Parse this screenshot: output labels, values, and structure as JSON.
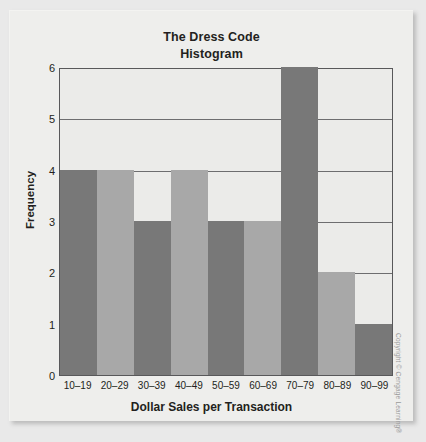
{
  "figure": {
    "title_line1": "The Dress Code",
    "title_line2": "Histogram",
    "copyright": "Copyright © Cengage Learning®",
    "panel_bg": "#eeeeec",
    "plot_bg": "#ebebe9",
    "axis_color": "#58585a",
    "text_color": "#231f20"
  },
  "chart_data": {
    "type": "bar",
    "title": "The Dress Code Histogram",
    "xlabel": "Dollar Sales per Transaction",
    "ylabel": "Frequency",
    "categories": [
      "10–19",
      "20–29",
      "30–39",
      "40–49",
      "50–59",
      "60–69",
      "70–79",
      "80–89",
      "90–99"
    ],
    "values": [
      4,
      4,
      3,
      4,
      3,
      3,
      6,
      2,
      1
    ],
    "bar_colors": [
      "#787878",
      "#a8a8a8",
      "#787878",
      "#a8a8a8",
      "#787878",
      "#a8a8a8",
      "#787878",
      "#a8a8a8",
      "#787878"
    ],
    "ylim": [
      0,
      6
    ],
    "yticks": [
      0,
      1,
      2,
      3,
      4,
      5,
      6
    ],
    "ytick_labels": [
      "0",
      "1",
      "2",
      "3",
      "4",
      "5",
      "6"
    ],
    "grid": true,
    "grid_axis": "y",
    "legend": false
  }
}
